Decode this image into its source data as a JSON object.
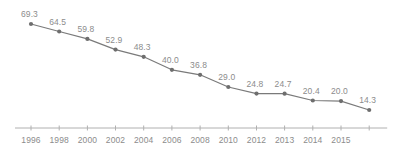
{
  "chart_data": {
    "type": "line",
    "title": "",
    "subtitle": "",
    "xlabel": "",
    "ylabel": "",
    "grid": false,
    "legend": false,
    "legend_position": "none",
    "y_axis_visible": false,
    "x_axis_visible": true,
    "ylim": [
      0,
      75
    ],
    "categories": [
      "1996",
      "1998",
      "2000",
      "2002",
      "2004",
      "2006",
      "2008",
      "2010",
      "2012",
      "2013",
      "2014",
      "2015"
    ],
    "values": [
      69.3,
      64.5,
      59.8,
      52.9,
      48.3,
      40.0,
      36.8,
      29.0,
      24.8,
      24.7,
      20.4,
      20.0
    ],
    "series": [
      {
        "name": "",
        "values": [
          69.3,
          64.5,
          59.8,
          52.9,
          48.3,
          40.0,
          36.8,
          29.0,
          24.8,
          24.7,
          20.4,
          20.0
        ],
        "color": "#7a7a7a"
      }
    ],
    "point_labels": [
      "69.3",
      "64.5",
      "59.8",
      "52.9",
      "48.3",
      "40.0",
      "36.8",
      "29.0",
      "24.8",
      "24.7",
      "20.4",
      "20.0"
    ],
    "final_point": {
      "label": "14.3",
      "value": 14.3
    },
    "colors": {
      "line": "#7a7a7a",
      "marker": "#6e6e6e",
      "text": "#8c8c8c",
      "axis": "#b0b0b0",
      "background": "#ffffff"
    }
  }
}
